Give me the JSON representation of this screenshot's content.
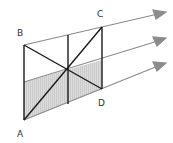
{
  "diagram": {
    "labels": {
      "A": "A",
      "B": "B",
      "C": "C",
      "D": "D"
    },
    "colors": {
      "frame": "#1a1a1a",
      "ray": "#8c8c8c",
      "shade": "#d4d4d4",
      "label": "#333333"
    }
  }
}
